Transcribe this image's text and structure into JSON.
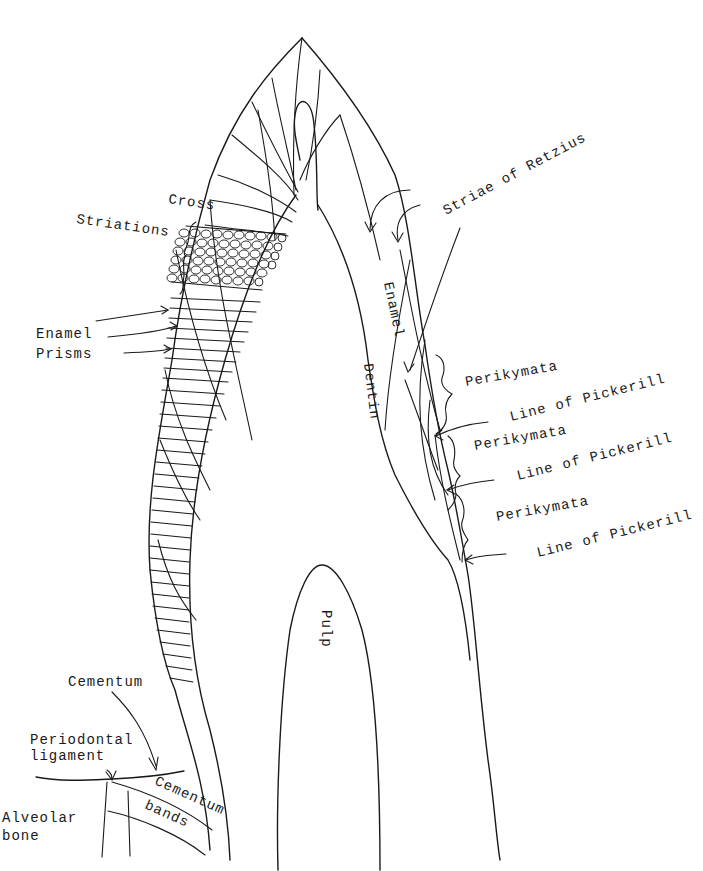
{
  "diagram": {
    "labels": {
      "cross_striations": [
        "Cross",
        "Striations"
      ],
      "enamel_prisms": [
        "Enamel",
        "Prisms"
      ],
      "striae_of_retzius": "Striae of Retzius",
      "enamel": "Enamel",
      "dentin": "Dentin",
      "pulp": "Pulp",
      "perikymata_1": "Perikymata",
      "line_of_pickerill_1": "Line of Pickerill",
      "perikymata_2": "Perikymata",
      "line_of_pickerill_2": "Line of Pickerill",
      "perikymata_3": "Perikymata",
      "line_of_pickerill_3": "Line of Pickerill",
      "cementum": "Cementum",
      "periodontal_ligament": [
        "Periodontal",
        "ligament"
      ],
      "cementum_bands": [
        "Cementum",
        "bands"
      ],
      "alveolar_bone": [
        "Alveolar",
        "bone"
      ]
    },
    "colors": {
      "ink": "#1a1a1a",
      "paper": "#ffffff"
    }
  }
}
